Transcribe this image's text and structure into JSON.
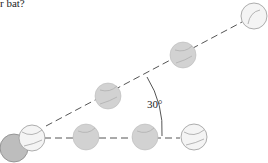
{
  "caption": "r bat?",
  "angle_label": "30°",
  "colors": {
    "line": "#555555",
    "ball_white": "#f4f4f4",
    "ball_gray": "#cfcfcf",
    "ball_dark": "#b5b5b5",
    "seam": "#888888"
  }
}
